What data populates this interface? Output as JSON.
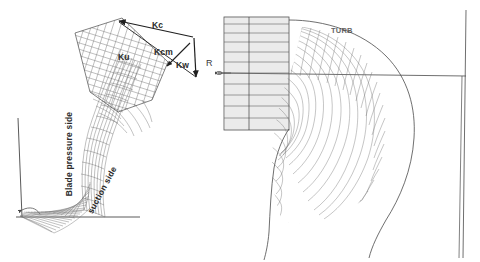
{
  "figure": {
    "background_color": "#ffffff",
    "line_color": "#555555",
    "text_color": "#2b2b2b",
    "width": 480,
    "height": 262
  },
  "left_panel": {
    "name": "blade-surface-3d-view",
    "velocity_triangle": {
      "name": "velocity-triangle",
      "vectors": [
        {
          "id": "Kc",
          "label": "Kc",
          "meaning": "absolute-velocity"
        },
        {
          "id": "Kcm",
          "label": "Kcm",
          "meaning": "meridional-velocity"
        },
        {
          "id": "Ku",
          "label": "Ku",
          "meaning": "blade-peripheral-velocity"
        },
        {
          "id": "Kw",
          "label": "Kw",
          "meaning": "relative-velocity"
        }
      ]
    },
    "surface_labels": [
      {
        "id": "pressure-side",
        "label": "Blade pressure side",
        "rotation_deg": -90
      },
      {
        "id": "suction-side",
        "label": "suction side",
        "rotation_deg": -62
      }
    ],
    "axes": {
      "vertical_axis": "axis-vertical",
      "horizontal_axis": "axis-horizontal",
      "angle_arc": "angle-arc-indicator"
    }
  },
  "right_panel": {
    "name": "meridional-grid-view",
    "radius_indicator": {
      "name": "radius-indicator",
      "label": "R"
    },
    "annotation": {
      "name": "region-annotation",
      "label": "TURB"
    },
    "meshes": [
      {
        "id": "inlet-duct-grid",
        "type": "rectangular-structured-grid"
      },
      {
        "id": "passage-fan-grid",
        "type": "radial-structured-grid"
      }
    ],
    "boundaries": [
      {
        "id": "outer-casing-curve"
      },
      {
        "id": "hub-curve"
      },
      {
        "id": "outlet-vertical-line"
      },
      {
        "id": "centerline-axis"
      }
    ]
  }
}
